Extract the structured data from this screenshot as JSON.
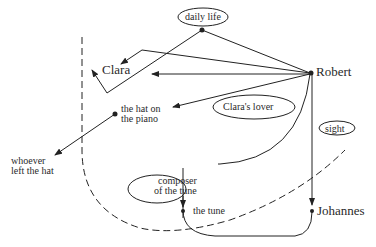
{
  "diagram": {
    "type": "concept-graph",
    "nodes": {
      "daily_life": "daily life",
      "clara": "Clara",
      "robert": "Robert",
      "hat_line1": "the hat on",
      "hat_line2": "the piano",
      "claras_lover": "Clara's lover",
      "whoever_line1": "whoever",
      "whoever_line2": "left the hat",
      "composer_line1": "composer",
      "composer_line2": "of the tune",
      "sight": "sight",
      "the_tune": "the tune",
      "johannes": "Johannes"
    },
    "edges": [
      {
        "from": "daily life",
        "to": "Robert"
      },
      {
        "from": "daily life",
        "to": "Clara",
        "style": "zigzag"
      },
      {
        "from": "Robert",
        "to": "Clara"
      },
      {
        "from": "Robert",
        "to": "Clara",
        "style": "zigzag"
      },
      {
        "from": "Robert",
        "to": "the hat on the piano"
      },
      {
        "from": "the hat on the piano",
        "to": "whoever left the hat"
      },
      {
        "from": "Robert",
        "to": "composer of the tune",
        "style": "curve"
      },
      {
        "from": "composer of the tune",
        "to": "the tune"
      },
      {
        "from": "Robert",
        "to": "Johannes"
      },
      {
        "from": "the tune",
        "to": "Johannes",
        "style": "curve"
      }
    ],
    "boundary": {
      "style": "dashed",
      "label": "sight"
    }
  }
}
